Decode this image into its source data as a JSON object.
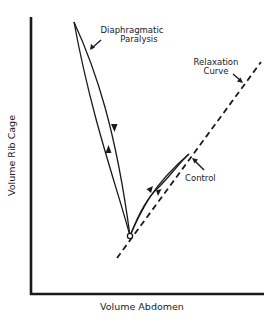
{
  "diagram": {
    "x_axis_label": "Volume Abdomen",
    "y_axis_label": "Volume Rib Cage",
    "labels": {
      "paralysis_line1": "Diaphragmatic",
      "paralysis_line2": "Paralysis",
      "relaxation_line1": "Relaxation",
      "relaxation_line2": "Curve",
      "control": "Control"
    },
    "colors": {
      "ink": "#1a1a1a",
      "background": "#ffffff"
    },
    "elements": [
      {
        "name": "relaxation-curve",
        "style": "dashed",
        "from": [
          117,
          258
        ],
        "to": [
          261,
          62
        ]
      },
      {
        "name": "diaphragmatic-paralysis-loop",
        "style": "solid",
        "vertex": [
          130,
          236
        ],
        "tip": [
          74,
          22
        ],
        "direction": "up left strand, down right strand"
      },
      {
        "name": "control-loop",
        "style": "solid",
        "vertex": [
          130,
          236
        ],
        "tip": [
          189,
          154
        ],
        "direction": "up left strand, down right strand"
      }
    ]
  }
}
